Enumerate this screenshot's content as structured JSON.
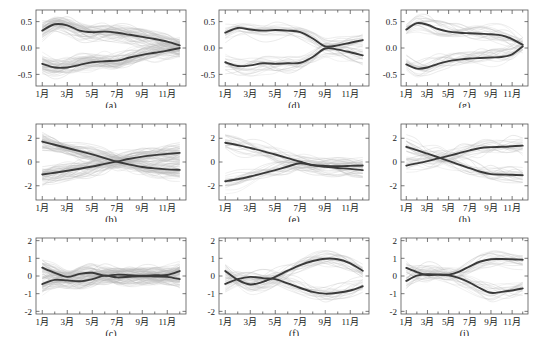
{
  "figure": {
    "rows": 3,
    "cols": 3,
    "background": "#ffffff",
    "axis_color": "#555555",
    "mean_curve_color": "#3a3a3a",
    "member_curve_color": "#b8b8b8"
  },
  "axes": {
    "ylabel": "SST异常/℃",
    "xlabel": "",
    "month_ticks": [
      "1月",
      "3月",
      "5月",
      "7月",
      "9月",
      "11月"
    ],
    "month_tick_values": [
      1,
      3,
      5,
      7,
      9,
      11
    ],
    "x_range": [
      0.5,
      12.5
    ]
  },
  "chart_data": {
    "type": "line",
    "title": "",
    "xlabel": "",
    "ylabel": "SST异常/℃",
    "grid": false,
    "legend": null,
    "x": [
      1,
      2,
      3,
      4,
      5,
      6,
      7,
      8,
      9,
      10,
      11,
      12
    ],
    "xticklabels": [
      "1月",
      "3月",
      "5月",
      "7月",
      "9月",
      "11月"
    ],
    "xtickvalues": [
      1,
      3,
      5,
      7,
      9,
      11
    ],
    "panels": [
      {
        "label": "(a)",
        "row": 0,
        "col": 0,
        "ylim": [
          -0.72,
          0.72
        ],
        "yticks": [
          -0.5,
          0.0,
          0.5
        ],
        "yticklabels": [
          "-0.5",
          "0.0",
          "0.5"
        ],
        "ylabel": "SST异常/℃",
        "n_members": 96,
        "series": [
          {
            "name": "cluster-mean-1",
            "values": [
              0.33,
              0.45,
              0.43,
              0.33,
              0.3,
              0.31,
              0.29,
              0.25,
              0.21,
              0.17,
              0.12,
              0.05
            ]
          },
          {
            "name": "cluster-mean-2",
            "values": [
              -0.3,
              -0.37,
              -0.37,
              -0.32,
              -0.27,
              -0.25,
              -0.24,
              -0.18,
              -0.13,
              -0.09,
              -0.05,
              0.0
            ]
          }
        ]
      },
      {
        "label": "(d)",
        "row": 0,
        "col": 1,
        "ylim": [
          -0.72,
          0.72
        ],
        "yticks": [
          -0.5,
          0.0,
          0.5
        ],
        "yticklabels": [
          "-0.5",
          "0.0",
          "0.5"
        ],
        "ylabel": "",
        "n_members": 42,
        "series": [
          {
            "name": "cluster-mean-1",
            "values": [
              0.29,
              0.38,
              0.35,
              0.33,
              0.34,
              0.33,
              0.3,
              0.18,
              0.03,
              0.05,
              0.1,
              0.15
            ]
          },
          {
            "name": "cluster-mean-2",
            "values": [
              -0.27,
              -0.34,
              -0.33,
              -0.29,
              -0.3,
              -0.29,
              -0.28,
              -0.17,
              -0.01,
              -0.03,
              -0.08,
              -0.14
            ]
          }
        ]
      },
      {
        "label": "(g)",
        "row": 0,
        "col": 2,
        "ylim": [
          -0.72,
          0.72
        ],
        "yticks": [
          -0.5,
          0.0,
          0.5
        ],
        "yticklabels": [
          "-0.5",
          "0.0",
          "0.5"
        ],
        "ylabel": "",
        "n_members": 40,
        "series": [
          {
            "name": "cluster-mean-1",
            "values": [
              0.35,
              0.47,
              0.44,
              0.36,
              0.31,
              0.29,
              0.28,
              0.27,
              0.26,
              0.24,
              0.17,
              0.06
            ]
          },
          {
            "name": "cluster-mean-2",
            "values": [
              -0.31,
              -0.39,
              -0.37,
              -0.3,
              -0.25,
              -0.22,
              -0.2,
              -0.19,
              -0.18,
              -0.17,
              -0.12,
              0.03
            ]
          }
        ]
      },
      {
        "label": "(b)",
        "row": 1,
        "col": 0,
        "ylim": [
          -3.2,
          3.2
        ],
        "yticks": [
          -2,
          0,
          2
        ],
        "yticklabels": [
          "-2",
          "0",
          "2"
        ],
        "ylabel": "SST异常/℃",
        "n_members": 96,
        "series": [
          {
            "name": "cluster-mean-1",
            "values": [
              1.72,
              1.45,
              1.18,
              0.92,
              0.64,
              0.33,
              0.02,
              -0.22,
              -0.42,
              -0.54,
              -0.62,
              -0.66
            ]
          },
          {
            "name": "cluster-mean-2",
            "values": [
              -1.05,
              -0.9,
              -0.74,
              -0.57,
              -0.38,
              -0.16,
              0.05,
              0.27,
              0.45,
              0.58,
              0.68,
              0.77
            ]
          }
        ]
      },
      {
        "label": "(e)",
        "row": 1,
        "col": 1,
        "ylim": [
          -3.2,
          3.2
        ],
        "yticks": [
          -2,
          0,
          2
        ],
        "yticklabels": [
          "-2",
          "0",
          "2"
        ],
        "ylabel": "",
        "n_members": 42,
        "series": [
          {
            "name": "cluster-mean-1",
            "values": [
              1.62,
              1.42,
              1.18,
              0.92,
              0.63,
              0.33,
              0.02,
              -0.25,
              -0.33,
              -0.35,
              -0.33,
              -0.3
            ]
          },
          {
            "name": "cluster-mean-2",
            "values": [
              -1.62,
              -1.45,
              -1.22,
              -0.96,
              -0.68,
              -0.38,
              -0.1,
              -0.28,
              -0.4,
              -0.5,
              -0.58,
              -0.68
            ]
          }
        ]
      },
      {
        "label": "(h)",
        "row": 1,
        "col": 2,
        "ylim": [
          -3.2,
          3.2
        ],
        "yticks": [
          -2,
          0,
          2
        ],
        "yticklabels": [
          "-2",
          "0",
          "2"
        ],
        "ylabel": "",
        "n_members": 40,
        "series": [
          {
            "name": "cluster-mean-1",
            "values": [
              1.28,
              1.0,
              0.7,
              0.4,
              0.1,
              -0.22,
              -0.52,
              -0.82,
              -1.02,
              -1.05,
              -1.08,
              -1.12
            ]
          },
          {
            "name": "cluster-mean-2",
            "values": [
              -0.3,
              -0.12,
              0.08,
              0.3,
              0.52,
              0.75,
              0.98,
              1.18,
              1.25,
              1.28,
              1.32,
              1.38
            ]
          }
        ]
      },
      {
        "label": "(c)",
        "row": 2,
        "col": 0,
        "ylim": [
          -2.15,
          2.15
        ],
        "yticks": [
          -2,
          -1,
          0,
          1,
          2
        ],
        "yticklabels": [
          "-2",
          "-1",
          "0",
          "1",
          "2"
        ],
        "ylabel": "SST异常/℃",
        "n_members": 96,
        "series": [
          {
            "name": "cluster-mean-1",
            "values": [
              0.47,
              0.18,
              -0.05,
              0.12,
              0.18,
              0.02,
              0.08,
              0.05,
              0.02,
              0.04,
              0.06,
              0.28
            ]
          },
          {
            "name": "cluster-mean-2",
            "values": [
              -0.46,
              -0.22,
              -0.25,
              -0.3,
              -0.18,
              0.02,
              -0.08,
              -0.04,
              -0.01,
              -0.03,
              -0.05,
              -0.18
            ]
          }
        ]
      },
      {
        "label": "(f)",
        "row": 2,
        "col": 1,
        "ylim": [
          -2.15,
          2.15
        ],
        "yticks": [
          -2,
          -1,
          0,
          1,
          2
        ],
        "yticklabels": [
          "-2",
          "-1",
          "0",
          "1",
          "2"
        ],
        "ylabel": "",
        "n_members": 42,
        "series": [
          {
            "name": "cluster-mean-1",
            "values": [
              0.28,
              -0.22,
              -0.48,
              -0.33,
              -0.05,
              0.3,
              0.62,
              0.85,
              0.98,
              0.95,
              0.72,
              0.3
            ]
          },
          {
            "name": "cluster-mean-2",
            "values": [
              -0.45,
              -0.18,
              -0.05,
              -0.12,
              -0.18,
              -0.42,
              -0.68,
              -0.9,
              -1.0,
              -0.95,
              -0.82,
              -0.58
            ]
          }
        ]
      },
      {
        "label": "(i)",
        "row": 2,
        "col": 2,
        "ylim": [
          -2.15,
          2.15
        ],
        "yticks": [
          -2,
          -1,
          0,
          1,
          2
        ],
        "yticklabels": [
          "-2",
          "-1",
          "0",
          "1",
          "2"
        ],
        "ylabel": "",
        "n_members": 40,
        "series": [
          {
            "name": "cluster-mean-1",
            "values": [
              0.46,
              0.22,
              0.05,
              0.08,
              0.08,
              0.25,
              0.55,
              0.82,
              0.95,
              0.96,
              0.95,
              0.92
            ]
          },
          {
            "name": "cluster-mean-2",
            "values": [
              -0.28,
              0.02,
              0.1,
              0.08,
              0.04,
              -0.12,
              -0.38,
              -0.7,
              -0.95,
              -0.9,
              -0.82,
              -0.7
            ]
          }
        ]
      }
    ]
  }
}
